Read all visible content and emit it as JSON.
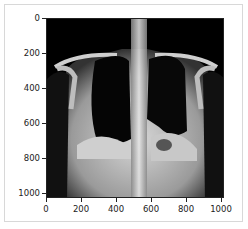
{
  "figure": {
    "kind": "matplotlib imshow",
    "image_subject": "frontal chest X-ray (grayscale)",
    "xticks": [
      "0",
      "200",
      "400",
      "600",
      "800",
      "1000"
    ],
    "yticks": [
      "0",
      "200",
      "400",
      "600",
      "800",
      "1000"
    ],
    "xlim": [
      0,
      1024
    ],
    "ylim": [
      1024,
      0
    ]
  }
}
